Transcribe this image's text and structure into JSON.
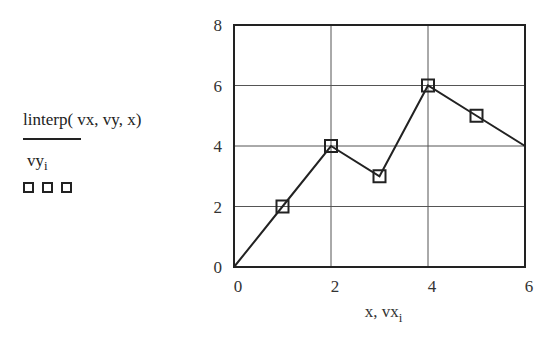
{
  "legend": {
    "trace1_expr": "linterp( vx, vy, x)",
    "trace2_base": "vy",
    "trace2_sub": "i"
  },
  "chart_data": {
    "type": "line",
    "title": "",
    "xlabel": "x, vx_i",
    "ylabel": "linterp(vx, vy, x); vy_i",
    "xlim": [
      0,
      6
    ],
    "ylim": [
      0,
      8
    ],
    "x_ticks": [
      "0",
      "2",
      "4",
      "6"
    ],
    "y_ticks": [
      "0",
      "2",
      "4",
      "6",
      "8"
    ],
    "grid": true,
    "series": [
      {
        "name": "linterp(vx, vy, x)",
        "style": "line",
        "x": [
          0,
          1,
          2,
          3,
          4,
          5,
          6
        ],
        "values": [
          0,
          2,
          4,
          3,
          6,
          5,
          4
        ]
      },
      {
        "name": "vy_i",
        "style": "square-markers",
        "x": [
          1,
          2,
          3,
          4,
          5
        ],
        "values": [
          2,
          4,
          3,
          6,
          5
        ]
      }
    ]
  },
  "axis": {
    "xlabel_base": "x, vx",
    "xlabel_sub": "i"
  }
}
